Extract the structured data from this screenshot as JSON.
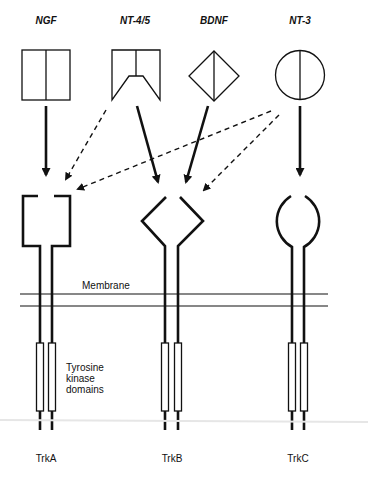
{
  "neurotrophins": [
    {
      "id": "ngf",
      "label": "NGF",
      "shape": "square-split"
    },
    {
      "id": "nt45",
      "label": "NT-4/5",
      "shape": "notched-square"
    },
    {
      "id": "bdnf",
      "label": "BDNF",
      "shape": "diamond-split"
    },
    {
      "id": "nt3",
      "label": "NT-3",
      "shape": "circle-split"
    }
  ],
  "receptors": [
    {
      "id": "trka",
      "label": "TrkA",
      "shape": "open-square"
    },
    {
      "id": "trkb",
      "label": "TrkB",
      "shape": "open-diamond"
    },
    {
      "id": "trkc",
      "label": "TrkC",
      "shape": "open-circle"
    }
  ],
  "annotations": {
    "membrane": "Membrane",
    "kinase_line1": "Tyrosine",
    "kinase_line2": "kinase",
    "kinase_line3": "domains"
  },
  "binding": {
    "primary": [
      {
        "from": "NGF",
        "to": "TrkA",
        "style": "solid"
      },
      {
        "from": "NT-4/5",
        "to": "TrkB",
        "style": "solid"
      },
      {
        "from": "BDNF",
        "to": "TrkB",
        "style": "solid"
      },
      {
        "from": "NT-3",
        "to": "TrkC",
        "style": "solid"
      }
    ],
    "secondary": [
      {
        "from": "NT-4/5",
        "to": "TrkA",
        "style": "dashed"
      },
      {
        "from": "NT-3",
        "to": "TrkA",
        "style": "dashed"
      },
      {
        "from": "NT-3",
        "to": "TrkB",
        "style": "dashed"
      }
    ]
  },
  "colors": {
    "stroke": "#111111",
    "background": "#ffffff",
    "separator": "#e6e6e6"
  }
}
